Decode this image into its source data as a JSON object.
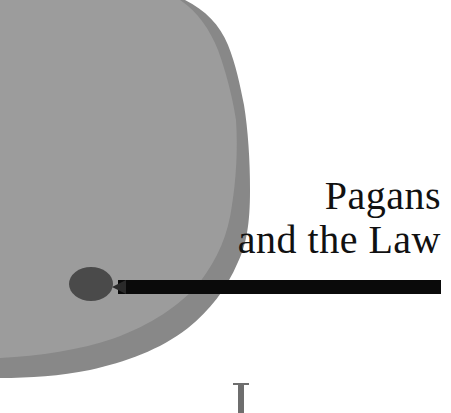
{
  "chapter": {
    "title_line1": "Pagans",
    "title_line2": "and the Law",
    "drop_cap": "I"
  },
  "colors": {
    "blotch_light": "#9b9b9b",
    "blotch_dark": "#858585",
    "bar": "#0a0a0a",
    "knob": "#4a4a4a",
    "text": "#111111"
  }
}
